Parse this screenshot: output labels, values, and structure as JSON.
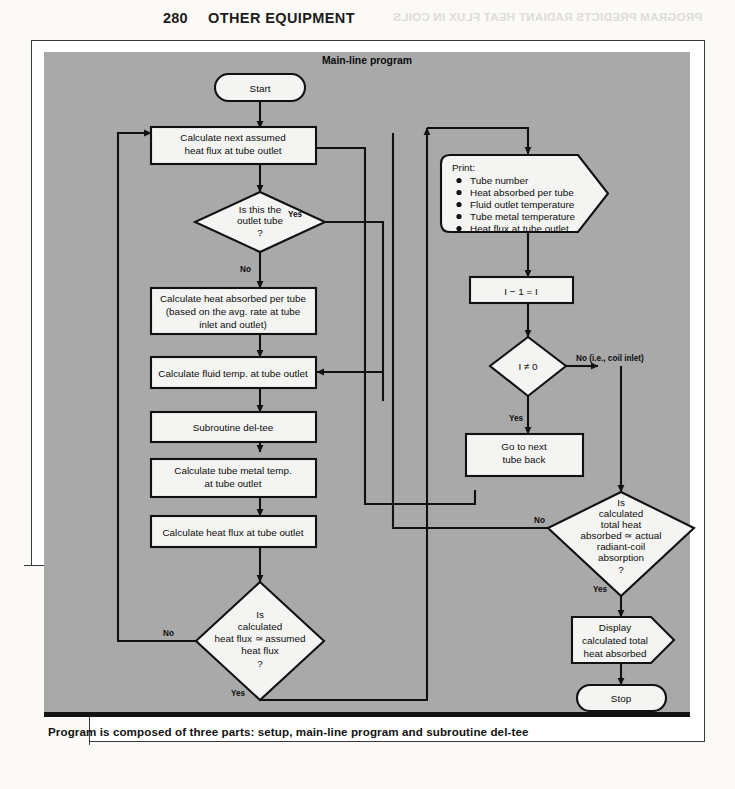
{
  "runhead": {
    "page_number": "280",
    "title": "OTHER EQUIPMENT",
    "bleed_through": "PROGRAM PREDICTS RADIANT HEAT FLUX IN COILS"
  },
  "figure": {
    "panel_title": "Main-line program",
    "caption": "Program is composed of three parts: setup, main-line program and subroutine del-tee"
  },
  "nodes": {
    "start": "Start",
    "calc_next_flux": "Calculate next assumed\nheat flux at tube outlet",
    "is_outlet_tube": "Is this the\noutlet tube\n?",
    "calc_heat_absorbed": "Calculate heat absorbed per tube\n(based on the avg. rate at tube\ninlet and outlet)",
    "calc_fluid_temp": "Calculate fluid temp. at tube outlet",
    "subroutine": "Subroutine del-tee",
    "calc_metal_temp": "Calculate tube metal temp.\nat tube outlet",
    "calc_heat_flux": "Calculate heat flux at tube outlet",
    "is_flux_converged": "Is\ncalculated\nheat flux ≃ assumed\nheat flux\n?",
    "print_header": "Print:",
    "print_items": [
      "Tube number",
      "Heat absorbed per tube",
      "Fluid outlet temperature",
      "Tube metal temperature",
      "Heat flux at tube outlet"
    ],
    "decrement": "I − 1 = I",
    "i_not_zero": "I ≠ 0",
    "go_next_tube": "Go to next\ntube back",
    "is_total_heat": "Is\ncalculated\ntotal heat\nabsorbed ≃ actual\nradiant-coil\nabsorption\n?",
    "display_total": "Display\ncalculated total\nheat absorbed",
    "stop": "Stop"
  },
  "edge_labels": {
    "yes_outlet": "Yes",
    "no_outlet": "No",
    "no_flux": "No",
    "yes_flux": "Yes",
    "no_coil_inlet": "No  (i.e., coil inlet)",
    "yes_i_not_zero": "Yes",
    "no_total": "No",
    "yes_total": "Yes"
  },
  "colors": {
    "panel_bg": "#a9a9a9",
    "shape_fill": "#f4f4f2",
    "ink": "#111111",
    "page_bg": "#fbfaf7"
  }
}
